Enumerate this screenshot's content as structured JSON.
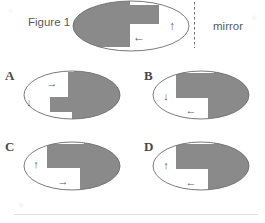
{
  "figure": {
    "caption_label": "Figure 1",
    "mirror_label": "mirror",
    "option_labels": {
      "a": "A",
      "b": "B",
      "c": "C",
      "d": "D"
    },
    "arrow_glyphs": {
      "up": "↑",
      "down": "↓",
      "left": "←",
      "right": "→"
    },
    "colors": {
      "shaded": "#8a8a8a",
      "shaded_edge": "#7e7e7e",
      "outline": "#6e6e6e",
      "text": "#4f4f4f",
      "background": "#ffffff",
      "rule": "#e2e2e2"
    },
    "panels": [
      {
        "id": "reference",
        "label": "Figure 1",
        "shaded_side": "left",
        "arrows": [
          {
            "name": "inner-square-arrow",
            "direction": "left",
            "glyph": "←"
          },
          {
            "name": "outer-field-arrow",
            "direction": "up",
            "glyph": "↑"
          }
        ],
        "notch": "top-right"
      },
      {
        "id": "a",
        "label": "A",
        "shaded_side": "right",
        "arrows": [
          {
            "name": "inner-square-arrow",
            "direction": "right",
            "glyph": "→"
          },
          {
            "name": "outer-field-arrow",
            "direction": "down",
            "glyph": "↓"
          }
        ],
        "notch": "bottom-left"
      },
      {
        "id": "b",
        "label": "B",
        "shaded_side": "right",
        "arrows": [
          {
            "name": "outer-field-arrow",
            "direction": "down",
            "glyph": "↓"
          },
          {
            "name": "inner-square-arrow",
            "direction": "left",
            "glyph": "←"
          }
        ],
        "notch": "top-right"
      },
      {
        "id": "c",
        "label": "C",
        "shaded_side": "right",
        "arrows": [
          {
            "name": "outer-field-arrow",
            "direction": "up",
            "glyph": "↑"
          },
          {
            "name": "inner-square-arrow",
            "direction": "right",
            "glyph": "→"
          }
        ],
        "notch": "top-left"
      },
      {
        "id": "d",
        "label": "D",
        "shaded_side": "right",
        "arrows": [
          {
            "name": "outer-field-arrow",
            "direction": "up",
            "glyph": "↑"
          },
          {
            "name": "inner-square-arrow",
            "direction": "left",
            "glyph": "←"
          }
        ],
        "notch": "top-right"
      }
    ]
  }
}
